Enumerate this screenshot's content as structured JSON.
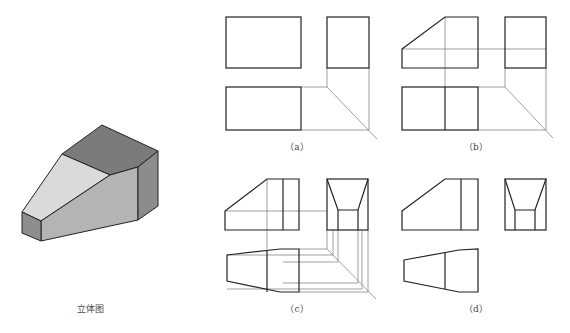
{
  "figure": {
    "iso_view": {
      "caption": "立体图"
    },
    "panels": [
      {
        "id": "a",
        "caption": "（a）"
      },
      {
        "id": "b",
        "caption": "（b）"
      },
      {
        "id": "c",
        "caption": "（c）"
      },
      {
        "id": "d",
        "caption": "（d）"
      }
    ]
  },
  "colors": {
    "outline": "#222222",
    "construction": "#777777",
    "face_top": "#7d7d7d",
    "face_slope": "#d9d9d9",
    "face_front": "#b5b5b5",
    "face_right": "#8a8a8a",
    "face_left": "#8f8f8f"
  }
}
